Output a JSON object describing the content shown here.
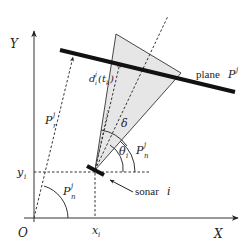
{
  "diagram": {
    "axes": {
      "x_label": "X",
      "y_label": "Y",
      "origin_label": "O"
    },
    "labels": {
      "plane": "plane",
      "plane_symbol": "P",
      "plane_sup": "j",
      "sonar": "sonar",
      "sonar_index": "i",
      "distance": "d",
      "distance_sup": "j",
      "distance_sub": "i",
      "distance_arg": "(t",
      "distance_arg_sub": "k",
      "distance_arg_close": ")",
      "pr_symbol": "P",
      "pr_sup": "j",
      "pr_sub": "r",
      "pn_symbol": "P",
      "pn_sup": "j",
      "pn_sub": "n",
      "delta": "δ",
      "theta": "θ",
      "theta_sub": "i",
      "yi": "y",
      "yi_sub": "i",
      "xi": "x",
      "xi_sub": "i"
    },
    "colors": {
      "ink": "#222222",
      "beam_fill": "#e6e6e6"
    }
  }
}
